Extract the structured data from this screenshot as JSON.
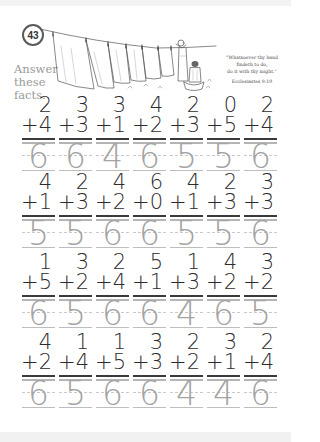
{
  "page_number": "43",
  "instructions": [
    "Answer",
    "these",
    "facts."
  ],
  "quote": {
    "lines": [
      "“Whatsoever thy hand",
      "findeth to do,",
      "do it with thy might.”"
    ],
    "reference": "Ecclesiastes 9:10"
  },
  "illustration": {
    "description": "clothesline with hanging sheets and a woman with a laundry basket",
    "icon": "clothesline-illustration"
  },
  "colors": {
    "given_digits": "#2c2c2c",
    "answer_digits": "#a3a3a3",
    "instructions_text": "#9a9a9a"
  },
  "operator": "+",
  "rows": [
    {
      "problems": [
        {
          "top": "2",
          "bottom": "4",
          "answer": "6"
        },
        {
          "top": "3",
          "bottom": "3",
          "answer": "6"
        },
        {
          "top": "3",
          "bottom": "1",
          "answer": "4"
        },
        {
          "top": "4",
          "bottom": "2",
          "answer": "6"
        },
        {
          "top": "2",
          "bottom": "3",
          "answer": "5"
        },
        {
          "top": "0",
          "bottom": "5",
          "answer": "5"
        },
        {
          "top": "2",
          "bottom": "4",
          "answer": "6"
        }
      ]
    },
    {
      "problems": [
        {
          "top": "4",
          "bottom": "1",
          "answer": "5"
        },
        {
          "top": "2",
          "bottom": "3",
          "answer": "5"
        },
        {
          "top": "4",
          "bottom": "2",
          "answer": "6"
        },
        {
          "top": "6",
          "bottom": "0",
          "answer": "6"
        },
        {
          "top": "4",
          "bottom": "1",
          "answer": "5"
        },
        {
          "top": "2",
          "bottom": "3",
          "answer": "5"
        },
        {
          "top": "3",
          "bottom": "3",
          "answer": "6"
        }
      ]
    },
    {
      "problems": [
        {
          "top": "1",
          "bottom": "5",
          "answer": "6"
        },
        {
          "top": "3",
          "bottom": "2",
          "answer": "5"
        },
        {
          "top": "2",
          "bottom": "4",
          "answer": "6"
        },
        {
          "top": "5",
          "bottom": "1",
          "answer": "6"
        },
        {
          "top": "1",
          "bottom": "3",
          "answer": "4"
        },
        {
          "top": "4",
          "bottom": "2",
          "answer": "6"
        },
        {
          "top": "3",
          "bottom": "2",
          "answer": "5"
        }
      ]
    },
    {
      "problems": [
        {
          "top": "4",
          "bottom": "2",
          "answer": "6"
        },
        {
          "top": "1",
          "bottom": "4",
          "answer": "5"
        },
        {
          "top": "1",
          "bottom": "5",
          "answer": "6"
        },
        {
          "top": "3",
          "bottom": "3",
          "answer": "6"
        },
        {
          "top": "2",
          "bottom": "2",
          "answer": "4"
        },
        {
          "top": "3",
          "bottom": "1",
          "answer": "4"
        },
        {
          "top": "2",
          "bottom": "4",
          "answer": "6"
        }
      ]
    }
  ]
}
